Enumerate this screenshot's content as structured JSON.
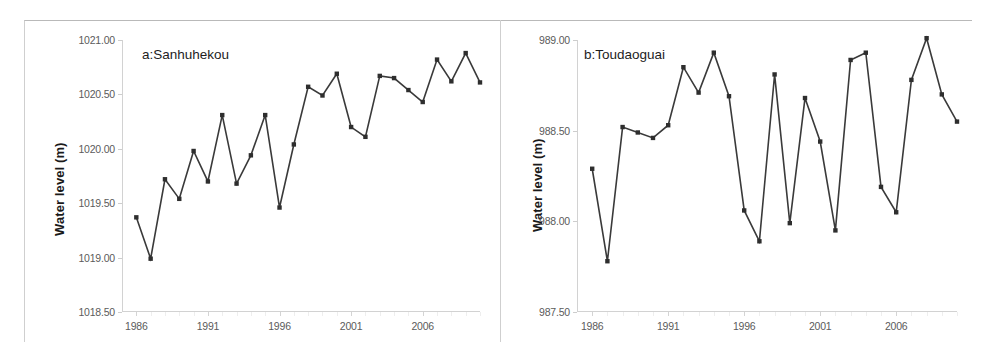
{
  "figure": {
    "background": "#ffffff",
    "line_color": "#3a3a3a",
    "marker_color": "#2e2e2e",
    "axis_color": "#d2d2d2",
    "tick_text_color": "#5b5b5b"
  },
  "panels": [
    {
      "id": "a",
      "label": "a:Sanhuhekou",
      "ylabel": "Water level (m)"
    },
    {
      "id": "b",
      "label": "b:Toudaoguai",
      "ylabel": "Water level (m)"
    }
  ],
  "chart_data": [
    {
      "type": "line",
      "title": "a:Sanhuhekou",
      "xlabel": "",
      "ylabel": "Water level (m)",
      "xlim": [
        1985,
        2010
      ],
      "ylim": [
        1018.5,
        1021.0
      ],
      "yticks": [
        1018.5,
        1019.0,
        1019.5,
        1020.0,
        1020.5,
        1021.0
      ],
      "ytick_labels": [
        "1018.50",
        "1019.00",
        "1019.50",
        "1020.00",
        "1020.50",
        "1021.00"
      ],
      "xticks": [
        1986,
        1991,
        1996,
        2001,
        2006
      ],
      "xtick_labels": [
        "1986",
        "1991",
        "1996",
        "2001",
        "2006"
      ],
      "grid": false,
      "legend": "none",
      "x": [
        1986,
        1987,
        1988,
        1989,
        1990,
        1991,
        1992,
        1993,
        1994,
        1995,
        1996,
        1997,
        1998,
        1999,
        2000,
        2001,
        2002,
        2003,
        2004,
        2005,
        2006,
        2007,
        2008,
        2009
      ],
      "values": [
        1019.37,
        1018.99,
        1019.72,
        1019.54,
        1019.98,
        1019.7,
        1020.31,
        1019.68,
        1019.94,
        1020.31,
        1019.46,
        1020.04,
        1020.57,
        1020.49,
        1020.69,
        1020.2,
        1020.11,
        1020.67,
        1020.65,
        1020.54,
        1020.43,
        1020.82,
        1020.62,
        1020.88,
        1020.61
      ]
    },
    {
      "type": "line",
      "title": "b:Toudaoguai",
      "xlabel": "",
      "ylabel": "Water level (m)",
      "xlim": [
        1985,
        2010
      ],
      "ylim": [
        987.5,
        989.0
      ],
      "yticks": [
        987.5,
        988.0,
        988.5,
        989.0
      ],
      "ytick_labels": [
        "987.50",
        "988.00",
        "988.50",
        "989.00"
      ],
      "xticks": [
        1986,
        1991,
        1996,
        2001,
        2006
      ],
      "xtick_labels": [
        "1986",
        "1991",
        "1996",
        "2001",
        "2006"
      ],
      "grid": false,
      "legend": "none",
      "x": [
        1986,
        1987,
        1988,
        1989,
        1990,
        1991,
        1992,
        1993,
        1994,
        1995,
        1996,
        1997,
        1998,
        1999,
        2000,
        2001,
        2002,
        2003,
        2004,
        2005,
        2006,
        2007,
        2008,
        2009
      ],
      "values": [
        988.29,
        987.78,
        988.52,
        988.49,
        988.46,
        988.53,
        988.85,
        988.71,
        988.93,
        988.69,
        988.06,
        987.89,
        988.81,
        987.99,
        988.68,
        988.44,
        987.95,
        988.89,
        988.93,
        988.19,
        988.05,
        988.78,
        989.01,
        988.7,
        988.55
      ]
    }
  ]
}
